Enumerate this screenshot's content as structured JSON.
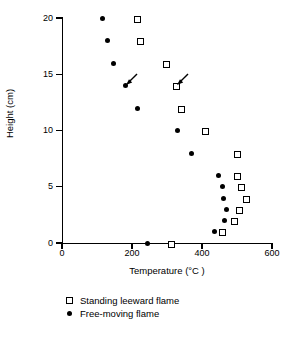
{
  "chart_data": {
    "type": "scatter",
    "title": "",
    "xlabel": "Temperature (°C )",
    "ylabel": "Height (cm)",
    "xlim": [
      0,
      600
    ],
    "ylim": [
      0,
      20
    ],
    "xticks": [
      0,
      200,
      400,
      600
    ],
    "yticks": [
      0,
      5,
      10,
      15,
      20
    ],
    "xtick_labels": [
      "0",
      "200",
      "400",
      "600"
    ],
    "ytick_labels": [
      "0",
      "5",
      "10",
      "15",
      "20"
    ],
    "grid": false,
    "legend_position": "below-plot-left",
    "series": [
      {
        "name": "Standing leeward flame",
        "marker": "open-square",
        "color": "#000000",
        "points": [
          {
            "x": 310,
            "y": 0
          },
          {
            "x": 455,
            "y": 1
          },
          {
            "x": 490,
            "y": 2
          },
          {
            "x": 505,
            "y": 3
          },
          {
            "x": 525,
            "y": 4
          },
          {
            "x": 510,
            "y": 5
          },
          {
            "x": 498,
            "y": 6
          },
          {
            "x": 498,
            "y": 8
          },
          {
            "x": 408,
            "y": 10
          },
          {
            "x": 338,
            "y": 12
          },
          {
            "x": 325,
            "y": 14
          },
          {
            "x": 295,
            "y": 16
          },
          {
            "x": 222,
            "y": 18
          },
          {
            "x": 212,
            "y": 20
          }
        ]
      },
      {
        "name": "Free-moving flame",
        "marker": "filled-circle",
        "color": "#000000",
        "points": [
          {
            "x": 245,
            "y": 0
          },
          {
            "x": 437,
            "y": 1
          },
          {
            "x": 465,
            "y": 2
          },
          {
            "x": 470,
            "y": 3
          },
          {
            "x": 462,
            "y": 4
          },
          {
            "x": 458,
            "y": 5
          },
          {
            "x": 448,
            "y": 6
          },
          {
            "x": 370,
            "y": 8
          },
          {
            "x": 330,
            "y": 10
          },
          {
            "x": 215,
            "y": 12
          },
          {
            "x": 180,
            "y": 14
          },
          {
            "x": 148,
            "y": 16
          },
          {
            "x": 130,
            "y": 18
          },
          {
            "x": 115,
            "y": 20
          }
        ]
      }
    ],
    "annotations": [
      {
        "label": "arrow",
        "target_x": 180,
        "target_y": 14,
        "points_to": "Free-moving flame 14 cm"
      },
      {
        "label": "arrow",
        "target_x": 325,
        "target_y": 14,
        "points_to": "Standing leeward flame 14 cm"
      }
    ]
  },
  "legend": {
    "items": [
      {
        "label": "Standing leeward flame",
        "marker": "open-square"
      },
      {
        "label": "Free-moving flame",
        "marker": "filled-circle"
      }
    ]
  }
}
